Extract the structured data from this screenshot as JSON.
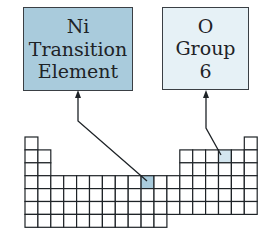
{
  "colors": {
    "background": "#ffffff",
    "line": "#1e2327",
    "transition_fill": "#a9cbdc",
    "group_fill": "#e6f1f6"
  },
  "callouts": [
    {
      "id": "ni",
      "symbol": "Ni",
      "lines": [
        "Ni",
        "Transition",
        "Element"
      ],
      "category": "Transition Element",
      "highlight_cell": {
        "period": 4,
        "group": 10
      }
    },
    {
      "id": "o",
      "symbol": "O",
      "lines": [
        "O",
        "Group",
        "6"
      ],
      "category": "Group 6",
      "highlight_cell": {
        "period": 2,
        "group": 16
      }
    }
  ],
  "grid": {
    "origin_x": 25,
    "origin_y": 137,
    "cell": 12.9,
    "rows": [
      [
        1,
        18
      ],
      [
        1,
        2,
        13,
        14,
        15,
        16,
        17,
        18
      ],
      [
        1,
        2,
        13,
        14,
        15,
        16,
        17,
        18
      ],
      [
        1,
        2,
        3,
        4,
        5,
        6,
        7,
        8,
        9,
        10,
        11,
        12,
        13,
        14,
        15,
        16,
        17,
        18
      ],
      [
        1,
        2,
        3,
        4,
        5,
        6,
        7,
        8,
        9,
        10,
        11,
        12,
        13,
        14,
        15,
        16,
        17,
        18
      ],
      [
        1,
        2,
        3,
        4,
        5,
        6,
        7,
        8,
        9,
        10,
        11,
        12,
        13,
        14,
        15,
        16,
        17,
        18
      ],
      [
        1,
        2,
        3,
        4,
        5,
        6,
        7,
        8,
        9,
        10,
        11
      ]
    ]
  }
}
